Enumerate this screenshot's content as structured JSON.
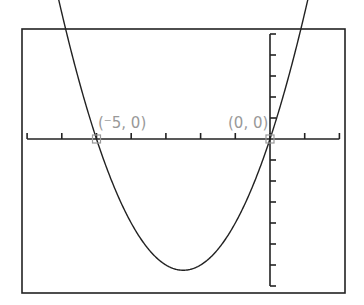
{
  "chart_data": {
    "type": "line",
    "title": "",
    "function": "y = x(x + 5)",
    "xlabel": "",
    "ylabel": "",
    "xlim": [
      -7,
      2
    ],
    "ylim": [
      -7,
      5
    ],
    "xscale": 1,
    "yscale": 1,
    "grid": false,
    "legend": null,
    "series": [
      {
        "name": "parabola",
        "x": [
          -7,
          -6,
          -5,
          -4,
          -3,
          -2.5,
          -2,
          -1,
          0,
          1,
          2
        ],
        "values": [
          14,
          6,
          0,
          -4,
          -6,
          -6.25,
          -6,
          -4,
          0,
          6,
          14
        ]
      }
    ],
    "marked_points": [
      {
        "x": -5,
        "y": 0,
        "label": "(⁻5, 0)"
      },
      {
        "x": 0,
        "y": 0,
        "label": "(0, 0)"
      }
    ]
  },
  "labels": {
    "point1": "(⁻5, 0)",
    "point2": "(0, 0)"
  }
}
